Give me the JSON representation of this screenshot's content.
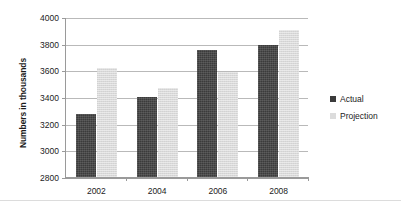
{
  "chart_data": {
    "type": "bar",
    "title": "",
    "subtitle": "",
    "xlabel": "",
    "ylabel": "Numbers in thousands",
    "categories": [
      "2002",
      "2004",
      "2006",
      "2008"
    ],
    "series": [
      {
        "name": "Actual",
        "color": "#3b3b3b",
        "values": [
          3270,
          3400,
          3750,
          3790
        ]
      },
      {
        "name": "Projection",
        "color": "#d9d9d9",
        "values": [
          3620,
          3470,
          3585,
          3905
        ]
      }
    ],
    "ylim": [
      2800,
      4000
    ],
    "ytick_step": 200,
    "ytick_labels": [
      "2800",
      "3000",
      "3200",
      "3400",
      "3600",
      "3800",
      "4000"
    ],
    "grid": true,
    "legend_position": "right",
    "annotations": []
  },
  "legend": {
    "items": [
      {
        "label": "Actual",
        "swatch": "actual-swatch"
      },
      {
        "label": "Projection",
        "swatch": "projection-swatch"
      }
    ]
  },
  "axes": {
    "y_title": "Numbers in thousands"
  }
}
